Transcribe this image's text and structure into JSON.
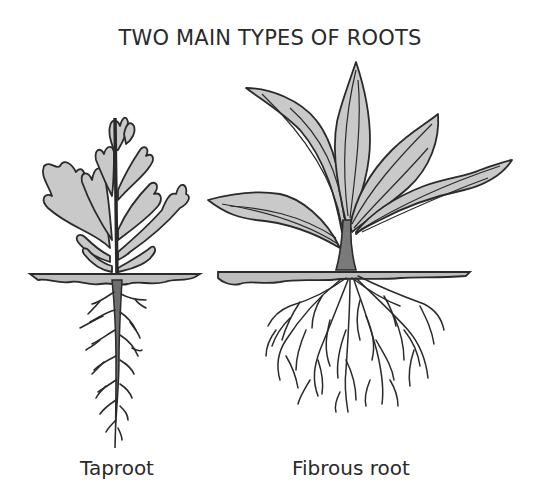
{
  "title": "TWO MAIN TYPES OF ROOTS",
  "plants": [
    {
      "label": "Taproot",
      "type": "taproot"
    },
    {
      "label": "Fibrous root",
      "type": "fibrous"
    }
  ],
  "colors": {
    "outline": "#2a2a2a",
    "leaf_fill": "#c9c9c9",
    "stem_fill": "#7a7a7a",
    "root_fill": "#6e6e6e",
    "ground_fill": "#bdbdbd",
    "background": "#ffffff"
  }
}
